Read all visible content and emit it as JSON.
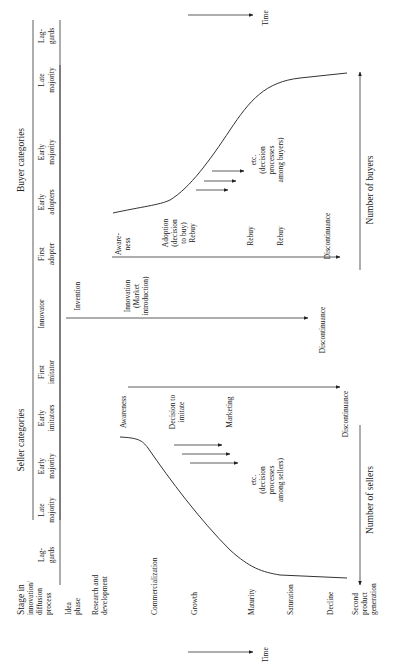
{
  "seller": {
    "title": "Seller categories",
    "categories": [
      "Lag-",
      "gards",
      "Late",
      "majority",
      "Early",
      "majority",
      "Early",
      "imitators",
      "First",
      "imitator",
      "Innovator"
    ],
    "events": {
      "awareness": "Awareness",
      "decision1": "Decision to",
      "decision2": "imitate",
      "marketing": "Marketing",
      "etc1": "etc.",
      "etc2": "(decision",
      "etc3": "processes",
      "etc4": "among sellers)",
      "discontinuance": "Discontinuance"
    },
    "axis_label": "Number of sellers"
  },
  "buyer": {
    "title": "Buyer categories",
    "categories": [
      "First",
      "adopter",
      "Early",
      "adopters",
      "Early",
      "majority",
      "Late",
      "majority",
      "Lag-",
      "gards"
    ],
    "events": {
      "awareness1": "Aware-",
      "awareness2": "ness",
      "adoption1": "Adoption",
      "adoption2": "(decision",
      "adoption3": "to buy)",
      "adoption4": "Rebuy",
      "rebuy1": "Rebuy",
      "rebuy2": "Rebuy",
      "etc1": "etc.",
      "etc2": "(decision",
      "etc3": "processes",
      "etc4": "among buyers)",
      "discontinuance": "Discontinuance"
    },
    "axis_label": "Number of buyers"
  },
  "innovator": {
    "invention": "Invention",
    "innovation1": "Innovation",
    "innovation2": "(Market",
    "innovation3": "introduction)",
    "discontinuance": "Discontinuance"
  },
  "stages": {
    "header1": "Stage in",
    "header2": "innovation/",
    "header3": "diffusion",
    "header4": "process",
    "items": [
      "Idea",
      "phase",
      "Research and",
      "development",
      "Commercialization",
      "Growth",
      "Maturity",
      "Saturation",
      "Decline",
      "Second",
      "product",
      "generation"
    ]
  },
  "time_label": "Time",
  "time_label_top": "Time"
}
